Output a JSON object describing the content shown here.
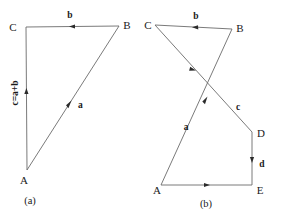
{
  "figure": {
    "caption_a": "(a)",
    "caption_b": "(b)",
    "panels": [
      {
        "id": "panel-a",
        "caption": "(a)",
        "vertices": [
          {
            "name": "C",
            "label": "C",
            "x": 26,
            "y": 27
          },
          {
            "name": "B",
            "label": "B",
            "x": 119,
            "y": 26
          },
          {
            "name": "A",
            "label": "A",
            "x": 27,
            "y": 170
          }
        ],
        "edges": [
          {
            "name": "edge-cb",
            "from": "C",
            "to": "B",
            "label": "b",
            "arrow_direction": "toward-C"
          },
          {
            "name": "edge-ab",
            "from": "A",
            "to": "B",
            "label": "a",
            "arrow_direction": "toward-B"
          },
          {
            "name": "edge-ac",
            "from": "A",
            "to": "C",
            "label": "c=a+b",
            "arrow_direction": "toward-C",
            "label_rotated": true
          }
        ]
      },
      {
        "id": "panel-b",
        "caption": "(b)",
        "vertices": [
          {
            "name": "C",
            "label": "C",
            "x": 155,
            "y": 25
          },
          {
            "name": "B",
            "label": "B",
            "x": 232,
            "y": 29
          },
          {
            "name": "D",
            "label": "D",
            "x": 252,
            "y": 132
          },
          {
            "name": "E",
            "label": "E",
            "x": 252,
            "y": 185
          },
          {
            "name": "A",
            "label": "A",
            "x": 161,
            "y": 185
          }
        ],
        "edges": [
          {
            "name": "edge-cb",
            "from": "C",
            "to": "B",
            "label": "b",
            "arrow_direction": "toward-C"
          },
          {
            "name": "edge-cd",
            "from": "C",
            "to": "D",
            "label": "c",
            "arrow_direction": "toward-D"
          },
          {
            "name": "edge-ab",
            "from": "A",
            "to": "B",
            "label": "a",
            "arrow_direction": "toward-B"
          },
          {
            "name": "edge-de",
            "from": "D",
            "to": "E",
            "label": "d",
            "arrow_direction": "toward-E"
          },
          {
            "name": "edge-ae",
            "from": "A",
            "to": "E",
            "label": "",
            "arrow_direction": "toward-E"
          }
        ]
      }
    ],
    "labels": {
      "a_lower": "a",
      "b_lower": "b",
      "c_lower": "c",
      "d_lower": "d",
      "c_sum": "c=a+b",
      "A": "A",
      "B": "B",
      "C": "C",
      "D": "D",
      "E": "E"
    },
    "colors": {
      "line": "#6b6b6b",
      "arrow": "#2b2b2b",
      "text": "#1a1a1a",
      "background": "#ffffff"
    }
  }
}
